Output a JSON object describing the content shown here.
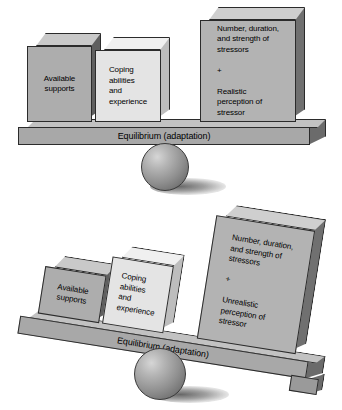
{
  "figure": {
    "panels": [
      {
        "id": "balanced",
        "state": "balanced",
        "beam_caption": "Equilibrium (adaptation)",
        "beam_tilt_degrees": 0,
        "blocks": [
          {
            "id": "available-supports",
            "label": "Available\nsupports",
            "side": "left",
            "face_color": "#adadad",
            "top_color": "#c9c9c9",
            "side_color": "#5f5f5f"
          },
          {
            "id": "coping-abilities",
            "label": "Coping\nabilities\nand\nexperience",
            "side": "left",
            "face_color": "#e4e4e4",
            "top_color": "#f0f0f0",
            "side_color": "#bdbdbd"
          },
          {
            "id": "stressors-realistic",
            "label": "Number, duration,\nand strength of\nstressors\n\n+\n\nRealistic\nperception of\nstressor",
            "side": "right",
            "face_color": "#b3b3b3",
            "top_color": "#cfcfcf",
            "side_color": "#707070"
          }
        ]
      },
      {
        "id": "tilted",
        "state": "imbalanced",
        "beam_caption": "Equilibrium (adaptation)",
        "beam_tilt_degrees": 9,
        "blocks": [
          {
            "id": "available-supports",
            "label": "Available\nsupports",
            "side": "left",
            "face_color": "#adadad",
            "top_color": "#c9c9c9",
            "side_color": "#5f5f5f"
          },
          {
            "id": "coping-abilities",
            "label": "Coping\nabilities\nand\nexperience",
            "side": "left",
            "face_color": "#e4e4e4",
            "top_color": "#f0f0f0",
            "side_color": "#bdbdbd"
          },
          {
            "id": "stressors-unrealistic",
            "label": "Number, duration,\nand strength of\nstressors\n\n+\n\nUnrealistic\nperception of\nstressor",
            "side": "right",
            "face_color": "#b3b3b3",
            "top_color": "#cfcfcf",
            "side_color": "#707070"
          }
        ]
      }
    ],
    "colors": {
      "beam_front": "#a8a8a8",
      "beam_top": "#c2c2c2",
      "beam_end": "#6b6b6b",
      "outline": "#2b2b2b",
      "background": "#ffffff"
    },
    "fulcrum": {
      "name": "sphere-fulcrum",
      "highlight_color": "#d6d6d6",
      "shade_color": "#5d5d5d"
    }
  }
}
